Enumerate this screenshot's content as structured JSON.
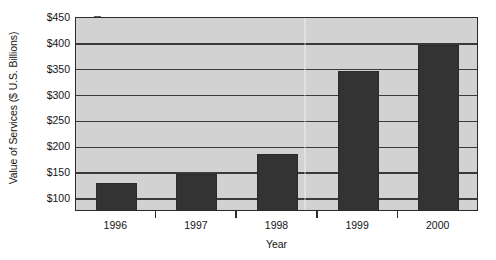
{
  "chart_data": {
    "type": "bar",
    "title": "",
    "subtitle": "",
    "xlabel": "Year",
    "ylabel": "Value of Services ($ U.S. Billions)",
    "categories": [
      "1996",
      "1997",
      "1998",
      "1999",
      "2000"
    ],
    "values": [
      132,
      149,
      188,
      348,
      398
    ],
    "series": [
      {
        "name": "Value of Services",
        "values": [
          132,
          149,
          188,
          348,
          398
        ]
      }
    ],
    "ylim": [
      75,
      450
    ],
    "ytick_values": [
      100,
      150,
      200,
      250,
      300,
      350,
      400,
      450
    ],
    "ytick_labels": [
      "$100",
      "$150",
      "$200",
      "$250",
      "$300",
      "$350",
      "$400",
      "$450"
    ],
    "xtick_labels": [
      "1996",
      "1997",
      "1998",
      "1999",
      "2000"
    ],
    "grid": "horizontal",
    "legend": "none",
    "annotations": [],
    "colors": {
      "bar_fill": "#333333",
      "plot_background": "#d2d2d2",
      "gridline": "#3a3a3a",
      "axis": "#2b2b2b",
      "text": "#141414",
      "figure_background": "#ffffff"
    }
  }
}
